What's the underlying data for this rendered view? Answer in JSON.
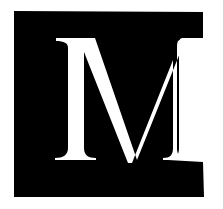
{
  "logo": {
    "letter": "M",
    "label": "M logo",
    "colors": {
      "background": "#ffffff",
      "block": "#000000",
      "letter": "#ffffff"
    }
  }
}
